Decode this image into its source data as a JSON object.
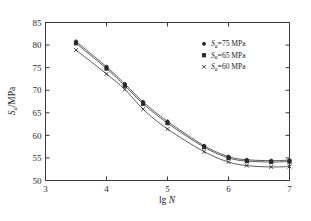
{
  "chart_data": {
    "type": "line",
    "title": "",
    "xlabel": "lg N",
    "xlabel_main": "lg",
    "xlabel_italic": "N",
    "ylabel": "Sa/MPa",
    "ylabel_main": "S",
    "ylabel_sub": "a",
    "ylabel_unit": "/MPa",
    "xlim": [
      3,
      7
    ],
    "ylim": [
      50,
      85
    ],
    "xticks": [
      3,
      4,
      5,
      6,
      7
    ],
    "xticklabels": [
      "3",
      "4",
      "5",
      "6",
      "7"
    ],
    "yticks": [
      50,
      55,
      60,
      65,
      70,
      75,
      80,
      85
    ],
    "yticklabels": [
      "50",
      "55",
      "60",
      "65",
      "70",
      "75",
      "80",
      "85"
    ],
    "grid": false,
    "legend_position": "upper-right",
    "x": [
      3.5,
      4.0,
      4.3,
      4.6,
      5.0,
      5.6,
      6.0,
      6.3,
      6.7,
      7.0
    ],
    "series": [
      {
        "name": "Sa=75 MPa",
        "label_main": "S",
        "label_sub": "a",
        "label_rest": "=75 MPa",
        "marker": "circle",
        "values": [
          80.8,
          75.2,
          71.4,
          67.4,
          63.1,
          57.7,
          55.3,
          54.6,
          54.4,
          54.5
        ]
      },
      {
        "name": "Sa=65 MPa",
        "label_main": "S",
        "label_sub": "a",
        "label_rest": "=65 MPa",
        "marker": "square",
        "values": [
          80.4,
          74.8,
          71.0,
          67.0,
          62.7,
          57.4,
          55.0,
          54.3,
          54.1,
          54.2
        ]
      },
      {
        "name": "Sa=60 MPa",
        "label_main": "S",
        "label_sub": "a",
        "label_rest": "=60 MPa",
        "marker": "cross",
        "values": [
          78.9,
          73.6,
          70.2,
          65.8,
          61.4,
          56.4,
          54.1,
          53.3,
          53.0,
          53.1
        ]
      }
    ],
    "colors": {
      "axis": "#3a3a3a",
      "curve": "#4a4a4a",
      "marker": "#2a2a2a",
      "text": "#1c1c1c",
      "background": "#ffffff"
    }
  }
}
